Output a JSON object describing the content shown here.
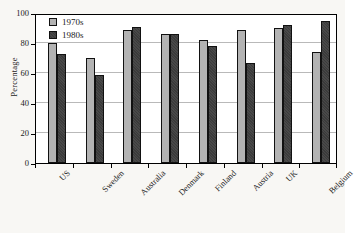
{
  "chart_data": {
    "type": "bar",
    "title": "",
    "xlabel": "",
    "ylabel": "Percentage",
    "ylim": [
      0,
      100
    ],
    "yticks": [
      0,
      20,
      40,
      60,
      80,
      100
    ],
    "grid": true,
    "legend_position": "top-left",
    "categories": [
      "US",
      "Sweden",
      "Australia",
      "Denmark",
      "Finland",
      "Austria",
      "UK",
      "Belgium"
    ],
    "series": [
      {
        "name": "1970s",
        "color": "#b3b3b3",
        "values": [
          80,
          70,
          89,
          86,
          82,
          89,
          90,
          74
        ]
      },
      {
        "name": "1980s",
        "color": "#3b3b3b",
        "values": [
          73,
          59,
          91,
          86,
          78,
          67,
          92,
          95
        ]
      }
    ]
  },
  "axis": {
    "y_title": "Percentage",
    "y_tick_labels": [
      "0",
      "20",
      "40",
      "60",
      "80",
      "100"
    ]
  },
  "legend": {
    "items": [
      {
        "label": "1970s"
      },
      {
        "label": "1980s"
      }
    ]
  }
}
